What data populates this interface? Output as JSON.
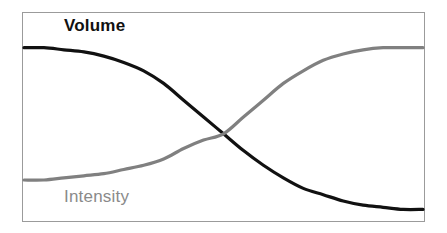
{
  "figure": {
    "background_color": "#ffffff",
    "frame": {
      "border_color": "#9b9b9b",
      "x": 22,
      "y": 12,
      "width": 403,
      "height": 210
    }
  },
  "labels": {
    "volume": "Volume",
    "intensity": "Intensity"
  },
  "colors": {
    "volume_curve": "#111111",
    "intensity_curve": "#808080",
    "volume_label": "#111111",
    "intensity_label": "#8a8a8a",
    "frame_border": "#9b9b9b"
  },
  "chart_data": {
    "type": "line",
    "title": "",
    "subtitle": "",
    "xlabel": "",
    "ylabel": "",
    "grid": false,
    "legend_position": "inline-annotation",
    "axis_ticks": false,
    "xlim": [
      0,
      100
    ],
    "ylim": [
      0,
      100
    ],
    "annotations": [
      {
        "text": "Volume",
        "x": 11,
        "y": 90,
        "color": "#111111",
        "bold": true
      },
      {
        "text": "Intensity",
        "x": 11,
        "y": 9,
        "color": "#8a8a8a",
        "bold": false
      }
    ],
    "crossing_point": {
      "x": 50,
      "y": 42
    },
    "series": [
      {
        "name": "Volume",
        "color": "#111111",
        "line_width": 3,
        "description": "High plateau on the left, sigmoid decay to a low plateau on the right",
        "x": [
          0,
          5,
          10,
          15,
          20,
          25,
          30,
          35,
          40,
          45,
          50,
          55,
          60,
          65,
          70,
          75,
          80,
          85,
          90,
          95,
          100
        ],
        "values": [
          83,
          83,
          82,
          81,
          79,
          76,
          72,
          66,
          58,
          50,
          42,
          34,
          27,
          21,
          16,
          13,
          10,
          8,
          7,
          6,
          6
        ]
      },
      {
        "name": "Intensity",
        "color": "#808080",
        "line_width": 3,
        "description": "Low plateau on the left, sigmoid rise to a high plateau on the right",
        "x": [
          0,
          5,
          10,
          15,
          20,
          25,
          30,
          35,
          40,
          45,
          50,
          55,
          60,
          65,
          70,
          75,
          80,
          85,
          90,
          95,
          100
        ],
        "values": [
          20,
          20,
          21,
          22,
          23,
          25,
          27,
          30,
          35,
          39,
          42,
          50,
          58,
          66,
          72,
          77,
          80,
          82,
          83,
          83,
          83
        ]
      }
    ]
  }
}
